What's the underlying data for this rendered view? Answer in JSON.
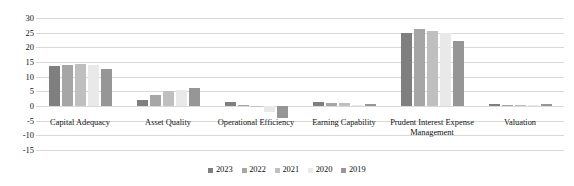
{
  "chart_data": {
    "type": "bar",
    "title": "",
    "xlabel": "",
    "ylabel": "",
    "ylim": [
      -15,
      30
    ],
    "yticks": [
      30,
      25,
      20,
      15,
      10,
      5,
      0,
      -5,
      -10,
      -15
    ],
    "grid": true,
    "legend_position": "bottom",
    "categories": [
      "Capital Adequacy",
      "Asset Quality",
      "Operational Efficiency",
      "Earning Capability",
      "Prudent Interest Expense Management",
      "Valuation"
    ],
    "series": [
      {
        "name": "2023",
        "color": "#7f7f7f",
        "values": [
          13.8,
          2.0,
          1.2,
          1.5,
          24.9,
          0.6
        ]
      },
      {
        "name": "2022",
        "color": "#a6a6a6",
        "values": [
          13.9,
          3.6,
          0.3,
          1.1,
          26.3,
          0.5
        ]
      },
      {
        "name": "2021",
        "color": "#bfbfbf",
        "values": [
          14.4,
          5.0,
          -0.3,
          0.9,
          25.6,
          0.5
        ]
      },
      {
        "name": "2020",
        "color": "#e9e9e9",
        "values": [
          14.0,
          5.6,
          -2.1,
          0.4,
          25.0,
          0.3
        ]
      },
      {
        "name": "2019",
        "color": "#969696",
        "values": [
          12.7,
          6.1,
          -4.2,
          0.8,
          22.3,
          0.6
        ]
      }
    ]
  },
  "legend": {
    "items": [
      {
        "label": "2023"
      },
      {
        "label": "2022"
      },
      {
        "label": "2021"
      },
      {
        "label": "2020"
      },
      {
        "label": "2019"
      }
    ]
  }
}
